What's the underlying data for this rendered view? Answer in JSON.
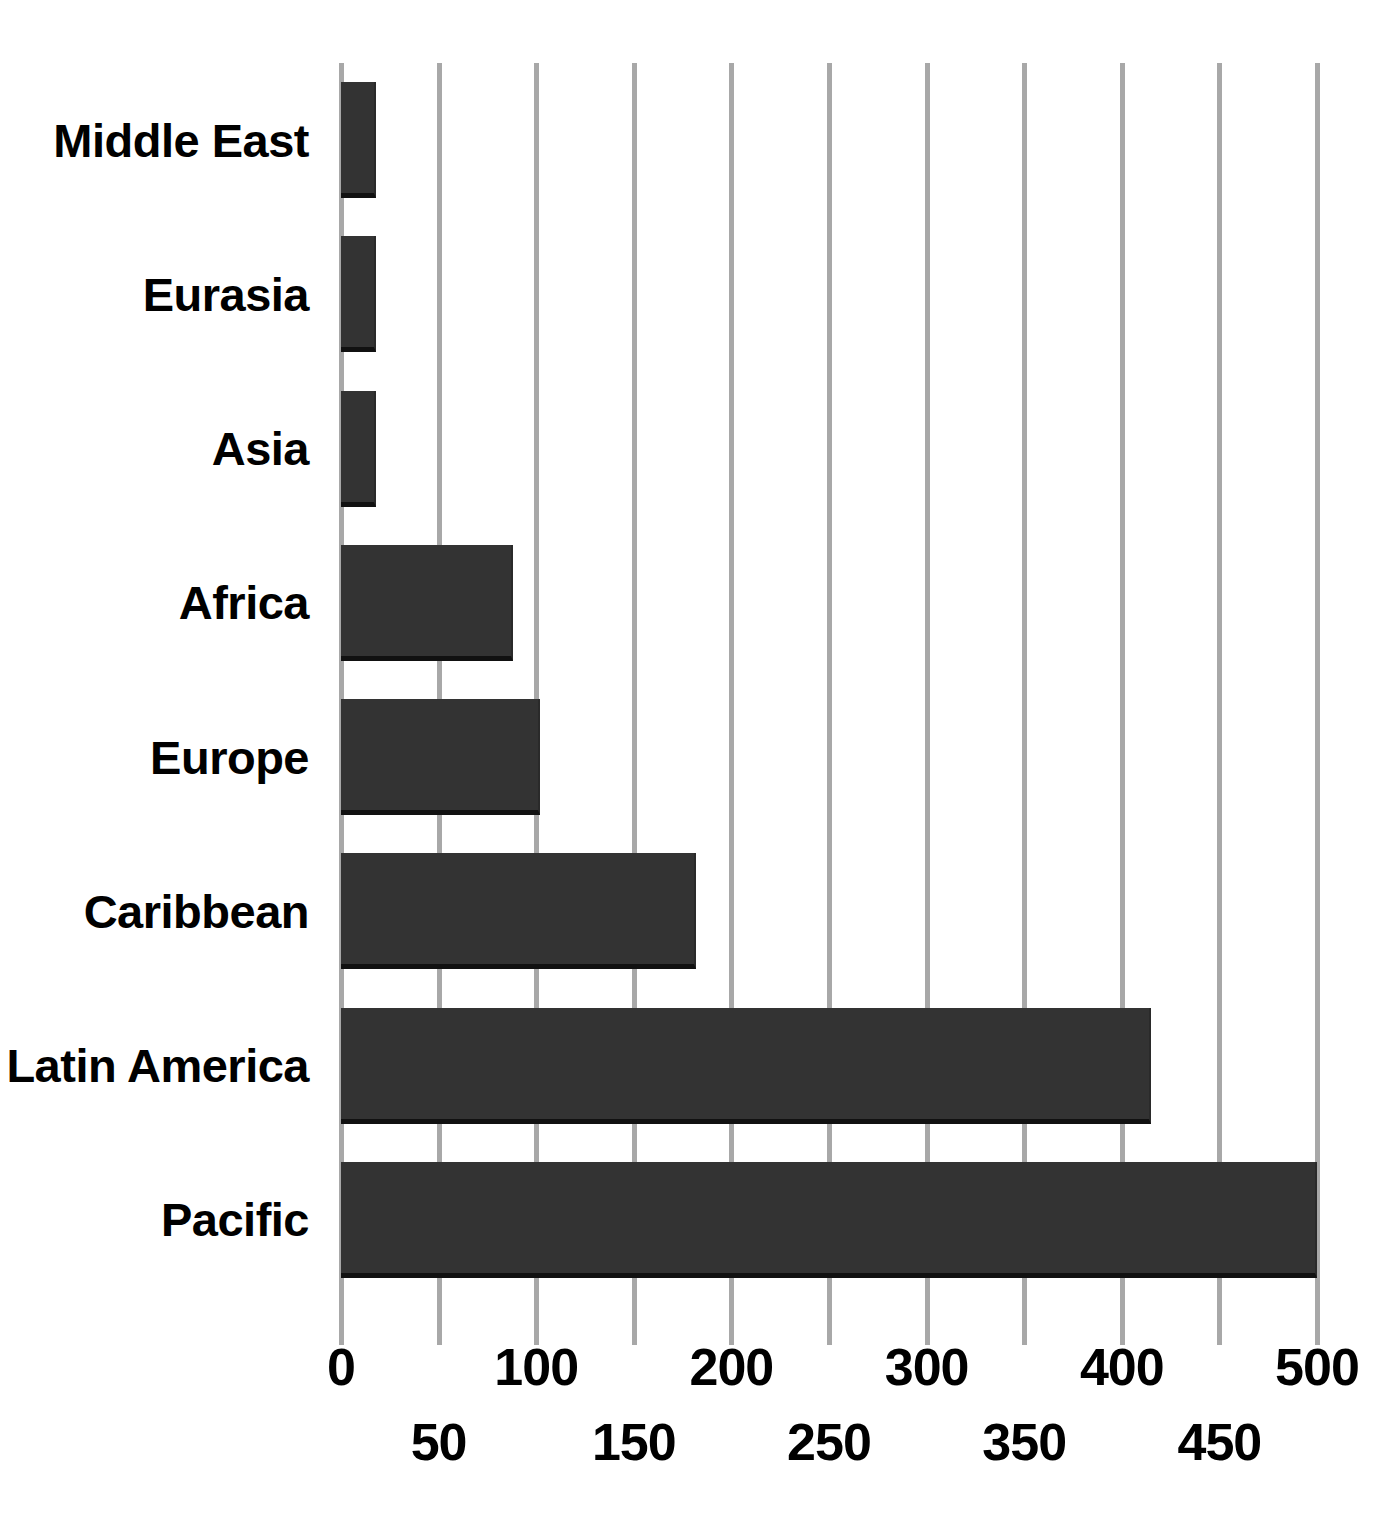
{
  "chart_data": {
    "type": "bar",
    "orientation": "horizontal",
    "title": "",
    "xlabel": "",
    "ylabel": "",
    "categories": [
      "Middle East",
      "Eurasia",
      "Asia",
      "Africa",
      "Europe",
      "Caribbean",
      "Latin America",
      "Pacific"
    ],
    "values": [
      18,
      18,
      18,
      88,
      102,
      182,
      415,
      500
    ],
    "xlim": [
      0,
      500
    ],
    "xticks_major": [
      0,
      100,
      200,
      300,
      400,
      500
    ],
    "xticks_minor": [
      50,
      150,
      250,
      350,
      450
    ],
    "xtick_labels_row1": [
      "0",
      "100",
      "200",
      "300",
      "400",
      "500"
    ],
    "xtick_labels_row2": [
      "50",
      "150",
      "250",
      "350",
      "450"
    ],
    "gridlines": [
      0,
      50,
      100,
      150,
      200,
      250,
      300,
      350,
      400,
      450,
      500
    ],
    "grid": true,
    "grid_axis": "x",
    "legend": null,
    "bar_color": "#333333",
    "bar_edge_color": "#111111",
    "grid_color": "#a8a8a8",
    "background_color": "#ffffff",
    "text_color": "#000000"
  }
}
